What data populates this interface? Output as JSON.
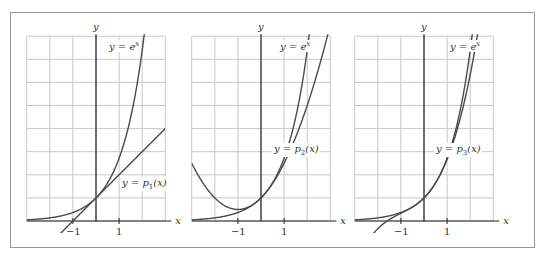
{
  "chart_data": [
    {
      "type": "line",
      "title": "",
      "xlabel": "x",
      "ylabel": "y",
      "xlim": [
        -3,
        3
      ],
      "ylim": [
        0,
        8
      ],
      "grid": true,
      "tick_labels": {
        "x": [
          "−1",
          "1"
        ]
      },
      "series": [
        {
          "name": "y = e^x",
          "function": "exp(x)",
          "label_text": "y = e",
          "label_sup": "x"
        },
        {
          "name": "y = p1(x)",
          "function": "1 + x",
          "label_text": "y = p",
          "label_sub": "1",
          "label_tail": "(x)"
        }
      ]
    },
    {
      "type": "line",
      "title": "",
      "xlabel": "x",
      "ylabel": "y",
      "xlim": [
        -3,
        3
      ],
      "ylim": [
        0,
        8
      ],
      "grid": true,
      "tick_labels": {
        "x": [
          "−1",
          "1"
        ]
      },
      "series": [
        {
          "name": "y = e^x",
          "function": "exp(x)",
          "label_text": "y = e",
          "label_sup": "x"
        },
        {
          "name": "y = p2(x)",
          "function": "1 + x + x^2/2",
          "label_text": "y = p",
          "label_sub": "2",
          "label_tail": "(x)"
        }
      ]
    },
    {
      "type": "line",
      "title": "",
      "xlabel": "x",
      "ylabel": "y",
      "xlim": [
        -3,
        3
      ],
      "ylim": [
        0,
        8
      ],
      "grid": true,
      "tick_labels": {
        "x": [
          "−1",
          "1"
        ]
      },
      "series": [
        {
          "name": "y = e^x",
          "function": "exp(x)",
          "label_text": "y = e",
          "label_sup": "x"
        },
        {
          "name": "y = p3(x)",
          "function": "1 + x + x^2/2 + x^3/6",
          "label_text": "y = p",
          "label_sub": "3",
          "label_tail": "(x)"
        }
      ]
    }
  ],
  "panels": [
    {
      "origin_px": [
        96,
        221
      ],
      "p_label_pos": [
        122,
        186
      ],
      "e_label_pos": [
        109,
        50
      ]
    },
    {
      "origin_px": [
        261,
        221
      ],
      "p_label_pos": [
        274,
        152
      ],
      "e_label_pos": [
        280,
        50
      ]
    },
    {
      "origin_px": [
        424,
        221
      ],
      "p_label_pos": [
        436,
        152
      ],
      "e_label_pos": [
        450,
        50
      ]
    }
  ],
  "colors": {
    "grid": "#c8c8c8",
    "axis": "#222222",
    "curve": "#4a4a4a",
    "frame": "#9a9a9a"
  }
}
